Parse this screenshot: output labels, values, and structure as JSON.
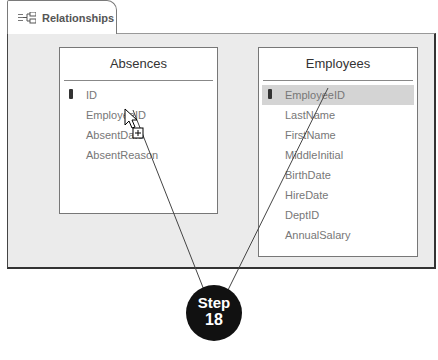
{
  "tab": {
    "label": "Relationships",
    "icon": "relationships-icon"
  },
  "tables": [
    {
      "name": "Absences",
      "fields": [
        {
          "name": "ID",
          "primary_key": true
        },
        {
          "name": "EmployeeID",
          "primary_key": false
        },
        {
          "name": "AbsentDate",
          "primary_key": false
        },
        {
          "name": "AbsentReason",
          "primary_key": false
        }
      ]
    },
    {
      "name": "Employees",
      "selected_field": "EmployeeID",
      "fields": [
        {
          "name": "EmployeeID",
          "primary_key": true
        },
        {
          "name": "LastName",
          "primary_key": false
        },
        {
          "name": "FirstName",
          "primary_key": false
        },
        {
          "name": "MiddleInitial",
          "primary_key": false
        },
        {
          "name": "BirthDate",
          "primary_key": false
        },
        {
          "name": "HireDate",
          "primary_key": false
        },
        {
          "name": "DeptID",
          "primary_key": false
        },
        {
          "name": "AnnualSalary",
          "primary_key": false
        }
      ]
    }
  ],
  "callout": {
    "word": "Step",
    "number": "18"
  },
  "colors": {
    "canvas": "#ebebeb",
    "selected_row": "#d4d4d4",
    "callout": "#111111"
  }
}
